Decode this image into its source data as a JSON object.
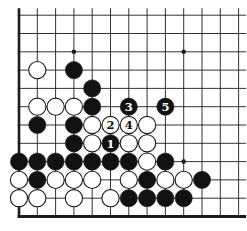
{
  "board": {
    "width": 247,
    "height": 231,
    "background_color": "#ffffff",
    "line_color": "#1c1c1c",
    "black_stone_color": "#121212",
    "white_stone_color": "#ffffff",
    "stone_outline_color": "#1c1c1c",
    "cols": 13,
    "rows": 12,
    "origin_x": 19,
    "origin_y": 15.2,
    "spacing": 18.3,
    "thin_line_width": 0.9,
    "thick_left_edge_width": 2.6,
    "thick_bottom_edge_width": 3,
    "top_overshoot": 7,
    "right_overshoot": 7.5,
    "stone_diameter": 17.2,
    "star_point_radius": 2.3,
    "label_font_size": 11.5,
    "star_points": [
      {
        "col": 3,
        "row": 2
      },
      {
        "col": 9,
        "row": 2
      },
      {
        "col": 9,
        "row": 8
      }
    ],
    "stones": [
      {
        "col": 1,
        "row": 3,
        "color": "white",
        "label": ""
      },
      {
        "col": 3,
        "row": 3,
        "color": "black",
        "label": ""
      },
      {
        "col": 4,
        "row": 4,
        "color": "black",
        "label": ""
      },
      {
        "col": 1,
        "row": 5,
        "color": "white",
        "label": ""
      },
      {
        "col": 2,
        "row": 5,
        "color": "white",
        "label": ""
      },
      {
        "col": 3,
        "row": 5,
        "color": "white",
        "label": ""
      },
      {
        "col": 4,
        "row": 5,
        "color": "black",
        "label": ""
      },
      {
        "col": 6,
        "row": 5,
        "color": "black",
        "label": "3"
      },
      {
        "col": 8,
        "row": 5,
        "color": "black",
        "label": "5"
      },
      {
        "col": 1,
        "row": 6,
        "color": "black",
        "label": ""
      },
      {
        "col": 3,
        "row": 6,
        "color": "black",
        "label": ""
      },
      {
        "col": 4,
        "row": 6,
        "color": "white",
        "label": ""
      },
      {
        "col": 5,
        "row": 6,
        "color": "white",
        "label": "2"
      },
      {
        "col": 6,
        "row": 6,
        "color": "white",
        "label": "4"
      },
      {
        "col": 7,
        "row": 6,
        "color": "white",
        "label": ""
      },
      {
        "col": 3,
        "row": 7,
        "color": "black",
        "label": ""
      },
      {
        "col": 4,
        "row": 7,
        "color": "white",
        "label": ""
      },
      {
        "col": 5,
        "row": 7,
        "color": "black",
        "label": "1"
      },
      {
        "col": 6,
        "row": 7,
        "color": "white",
        "label": ""
      },
      {
        "col": 7,
        "row": 7,
        "color": "white",
        "label": ""
      },
      {
        "col": 0,
        "row": 8,
        "color": "black",
        "label": ""
      },
      {
        "col": 1,
        "row": 8,
        "color": "black",
        "label": ""
      },
      {
        "col": 2,
        "row": 8,
        "color": "black",
        "label": ""
      },
      {
        "col": 3,
        "row": 8,
        "color": "black",
        "label": ""
      },
      {
        "col": 4,
        "row": 8,
        "color": "black",
        "label": ""
      },
      {
        "col": 5,
        "row": 8,
        "color": "black",
        "label": ""
      },
      {
        "col": 6,
        "row": 8,
        "color": "black",
        "label": ""
      },
      {
        "col": 7,
        "row": 8,
        "color": "white",
        "label": ""
      },
      {
        "col": 8,
        "row": 8,
        "color": "black",
        "label": ""
      },
      {
        "col": 0,
        "row": 9,
        "color": "white",
        "label": ""
      },
      {
        "col": 1,
        "row": 9,
        "color": "black",
        "label": ""
      },
      {
        "col": 2,
        "row": 9,
        "color": "white",
        "label": ""
      },
      {
        "col": 3,
        "row": 9,
        "color": "white",
        "label": ""
      },
      {
        "col": 4,
        "row": 9,
        "color": "white",
        "label": ""
      },
      {
        "col": 6,
        "row": 9,
        "color": "white",
        "label": ""
      },
      {
        "col": 7,
        "row": 9,
        "color": "black",
        "label": ""
      },
      {
        "col": 8,
        "row": 9,
        "color": "white",
        "label": ""
      },
      {
        "col": 9,
        "row": 9,
        "color": "white",
        "label": ""
      },
      {
        "col": 10,
        "row": 9,
        "color": "black",
        "label": ""
      },
      {
        "col": 0,
        "row": 10,
        "color": "white",
        "label": ""
      },
      {
        "col": 1,
        "row": 10,
        "color": "white",
        "label": ""
      },
      {
        "col": 3,
        "row": 10,
        "color": "white",
        "label": ""
      },
      {
        "col": 5,
        "row": 10,
        "color": "white",
        "label": ""
      },
      {
        "col": 6,
        "row": 10,
        "color": "black",
        "label": ""
      },
      {
        "col": 7,
        "row": 10,
        "color": "black",
        "label": ""
      },
      {
        "col": 8,
        "row": 10,
        "color": "black",
        "label": ""
      },
      {
        "col": 9,
        "row": 10,
        "color": "black",
        "label": ""
      }
    ],
    "move_sequence": [
      {
        "number": "1",
        "player": "black"
      },
      {
        "number": "2",
        "player": "white"
      },
      {
        "number": "3",
        "player": "black"
      },
      {
        "number": "4",
        "player": "white"
      },
      {
        "number": "5",
        "player": "black"
      }
    ]
  }
}
